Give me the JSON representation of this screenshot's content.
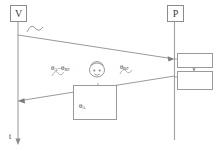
{
  "diagram": {
    "stroke_color": "#8c8c8c",
    "text_color": "#3c3c3c",
    "background": "#ffffff"
  },
  "endpoints": {
    "left": {
      "label": "V",
      "name": "vehicle-node"
    },
    "right": {
      "label": "P",
      "name": "partner-node"
    }
  },
  "time_axis": {
    "label": "t",
    "direction": "down"
  },
  "labels": {
    "theta_diff_prefix": "θ",
    "theta_diff": "θA–θRF",
    "theta_diff_base": "θ",
    "theta_diff_sub1": "A",
    "theta_diff_mid": "–θ",
    "theta_diff_sub2": "RF",
    "theta_rf_base": "θ",
    "theta_rf_sub": "RF",
    "theta_a_base": "θ",
    "theta_a_sub": "A"
  },
  "icons": {
    "source_wave": "sine-wave-icon",
    "person": "person-head-icon",
    "pulse_box": "pulse-waveform-icon",
    "multiplier": "multiply-circle-icon",
    "noisy_wave": "noisy-waveform-icon",
    "rf_convert": "wave-to-theta-icon",
    "rf_convert_arrow": "right-arrow-icon",
    "clock": "clock-gauge-icon",
    "down_arrow": "down-arrow-icon"
  },
  "arrows": {
    "forward": {
      "name": "forward-signal-arrow",
      "from": "V",
      "to": "P"
    },
    "return": {
      "name": "return-signal-arrow",
      "from": "P",
      "to": "V"
    }
  }
}
